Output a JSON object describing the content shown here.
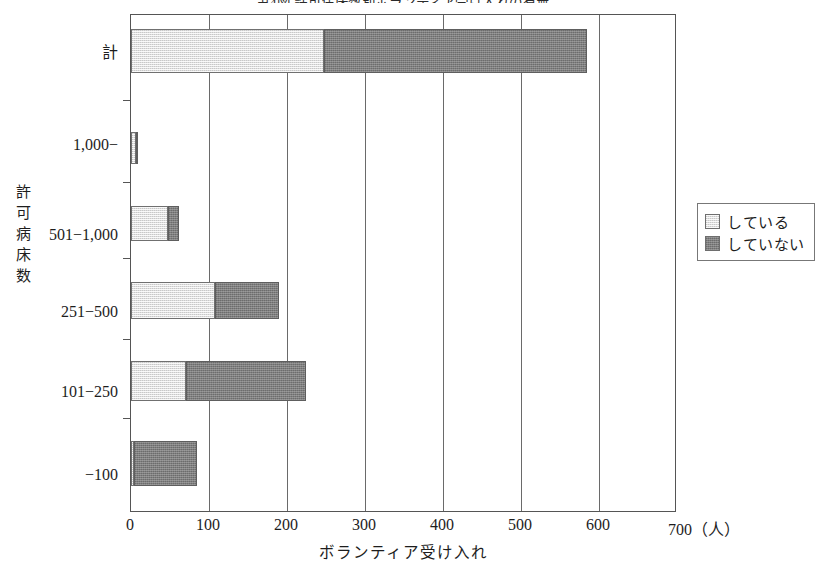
{
  "chart_data": {
    "type": "bar",
    "orientation": "horizontal",
    "stacked": true,
    "title": "第4図 許可病床数別ボランティア受け入れの有無",
    "xlabel": "ボランティア受け入れ",
    "ylabel": "許可病床数",
    "xunit": "700（人）",
    "xlim": [
      0,
      700
    ],
    "xticks": [
      0,
      100,
      200,
      300,
      400,
      500,
      600
    ],
    "xtick_labels": [
      "0",
      "100",
      "200",
      "300",
      "400",
      "500",
      "600"
    ],
    "grid": true,
    "grid_axis": "x",
    "legend_position": "right",
    "categories": [
      "計",
      "1,000−",
      "501−1,000",
      "251−500",
      "101−250",
      "−100"
    ],
    "series": [
      {
        "name": "している",
        "color": "#dedede",
        "values": [
          248,
          6,
          47,
          108,
          71,
          4
        ]
      },
      {
        "name": "していない",
        "color": "#7e7e7e",
        "values": [
          337,
          1,
          14,
          82,
          154,
          81
        ]
      }
    ],
    "totals": [
      585,
      7,
      61,
      190,
      225,
      85
    ]
  },
  "yaxis": {
    "title_chars": [
      "許",
      "可",
      "病",
      "床",
      "数"
    ]
  },
  "legend": {
    "items": [
      {
        "label": "している",
        "swatch": "light-gray-swatch"
      },
      {
        "label": "していない",
        "swatch": "dark-gray-swatch"
      }
    ]
  }
}
